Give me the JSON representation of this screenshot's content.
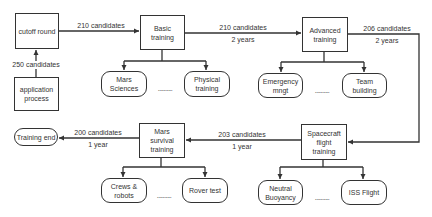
{
  "diagram": {
    "stages": {
      "cutoff": {
        "label": "cutoff round"
      },
      "application": {
        "label": "application process"
      },
      "basic": {
        "label": "Basic training"
      },
      "advanced": {
        "label": "Advanced training"
      },
      "spacecraft": {
        "label": "Spacecraft flight training"
      },
      "survival": {
        "label": "Mars survival training"
      },
      "end": {
        "label": "Training end"
      }
    },
    "subtopics": {
      "basic": [
        {
          "label": "Mars Sciences"
        },
        {
          "label": "Physical training"
        }
      ],
      "advanced": [
        {
          "label": "Emergency mngt"
        },
        {
          "label": "Team building"
        }
      ],
      "survival": [
        {
          "label": "Crews & robots"
        },
        {
          "label": "Rover test"
        }
      ],
      "spacecraft": [
        {
          "label": "Neutral Buoyancy"
        },
        {
          "label": "ISS Flight"
        }
      ]
    },
    "ellipsis": "..........",
    "edges": {
      "application_to_cutoff": {
        "candidates": "250 candidates"
      },
      "cutoff_to_basic": {
        "candidates": "210 candidates"
      },
      "basic_to_advanced": {
        "candidates": "210 candidates",
        "duration": "2 years"
      },
      "advanced_to_spacecraft": {
        "candidates": "206 candidates",
        "duration": "2 years"
      },
      "spacecraft_to_survival": {
        "candidates": "203 candidates",
        "duration": "1 year"
      },
      "survival_to_end": {
        "candidates": "200 candidates",
        "duration": "1 year"
      }
    },
    "colors": {
      "line": "#333333",
      "background": "#ffffff"
    }
  }
}
